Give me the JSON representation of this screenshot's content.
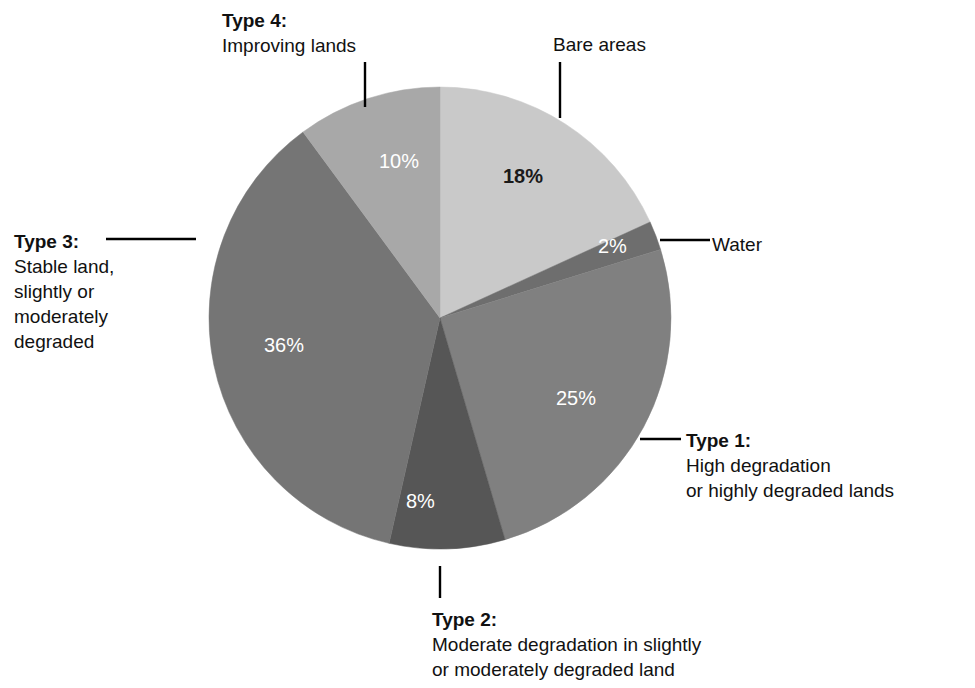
{
  "chart_data": {
    "type": "pie",
    "title": "",
    "subtitle": "",
    "xlabel": "",
    "ylabel": "",
    "legend_position": "callout-labels",
    "grid": false,
    "start_angle_deg": 0,
    "direction": "clockwise",
    "total": 99,
    "units": "%",
    "categories": [
      "Bare areas",
      "Water",
      "Type 1: High degradation or highly degraded lands",
      "Type 2: Moderate degradation in slightly or moderately degraded land",
      "Type 3: Stable land, slightly or moderately degraded",
      "Type 4: Improving lands"
    ],
    "values": [
      18,
      2,
      25,
      8,
      36,
      10
    ],
    "slices": [
      {
        "key": "bare-areas",
        "name": "Bare areas",
        "value": 18,
        "value_label": "18%",
        "color": "#c9c9c9",
        "label_color": "#1a1a1a",
        "label_bold": true
      },
      {
        "key": "water",
        "name": "Water",
        "value": 2,
        "value_label": "2%",
        "color": "#6e6e6e",
        "label_color": "#ffffff",
        "label_bold": false
      },
      {
        "key": "type-1",
        "name": "Type 1",
        "value": 25,
        "value_label": "25%",
        "color": "#808080",
        "label_color": "#ffffff",
        "label_bold": false
      },
      {
        "key": "type-2",
        "name": "Type 2",
        "value": 8,
        "value_label": "8%",
        "color": "#565656",
        "label_color": "#ffffff",
        "label_bold": false
      },
      {
        "key": "type-3",
        "name": "Type 3",
        "value": 36,
        "value_label": "36%",
        "color": "#757575",
        "label_color": "#ffffff",
        "label_bold": false
      },
      {
        "key": "type-4",
        "name": "Type 4",
        "value": 10,
        "value_label": "10%",
        "color": "#a8a8a8",
        "label_color": "#ffffff",
        "label_bold": false
      }
    ]
  },
  "callouts": {
    "type4": {
      "lead": "Type 4:",
      "lines": [
        "Improving lands"
      ]
    },
    "bare_areas": {
      "lead": "",
      "lines": [
        "Bare areas"
      ]
    },
    "water": {
      "lead": "",
      "lines": [
        "Water"
      ]
    },
    "type3": {
      "lead": "Type 3:",
      "lines": [
        "Stable land,",
        "slightly or",
        "moderately",
        "degraded"
      ]
    },
    "type1": {
      "lead": "Type 1:",
      "lines": [
        "High degradation",
        "or highly degraded lands"
      ]
    },
    "type2": {
      "lead": "Type 2:",
      "lines": [
        "Moderate degradation in slightly",
        "or moderately degraded land"
      ]
    }
  },
  "style": {
    "background": "#ffffff",
    "leader_color": "#000000",
    "text_color": "#111111"
  }
}
